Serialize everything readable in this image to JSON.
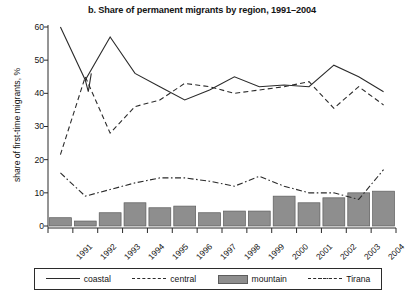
{
  "chart_data": {
    "type": "bar",
    "title": "b. Share of permanent migrants by region, 1991–2004",
    "xlabel": "",
    "ylabel": "share of first-time migrants, %",
    "ylim": [
      0,
      60
    ],
    "yticks": [
      0,
      10,
      20,
      30,
      40,
      50,
      60
    ],
    "grid": false,
    "legend_position": "bottom",
    "categories": [
      "1991",
      "1992",
      "1993",
      "1994",
      "1995",
      "1996",
      "1997",
      "1998",
      "1999",
      "2000",
      "2001",
      "2002",
      "2003",
      "2004"
    ],
    "series": [
      {
        "name": "coastal",
        "render": "line",
        "style": "solid",
        "color": "#2b2b2b",
        "values": [
          60,
          44,
          57,
          46,
          42,
          38,
          41,
          45,
          42,
          42.5,
          42,
          48.5,
          45,
          40.5
        ]
      },
      {
        "name": "central",
        "render": "line",
        "style": "dashed",
        "color": "#2b2b2b",
        "values": [
          21.5,
          45,
          28,
          36,
          38,
          43,
          42,
          40,
          41,
          42,
          43.5,
          35.5,
          42,
          36.5
        ]
      },
      {
        "name": "mountain",
        "render": "bar",
        "style": "filled",
        "color": "#8e8e8e",
        "values": [
          2.5,
          1.5,
          4,
          7,
          5.5,
          6,
          4,
          4.5,
          4.5,
          9,
          7,
          8.5,
          10,
          10.5
        ]
      },
      {
        "name": "Tirana",
        "render": "line",
        "style": "dash-dot",
        "color": "#2b2b2b",
        "values": [
          16,
          9,
          11,
          13,
          14.5,
          14.5,
          13.5,
          12,
          15,
          12,
          10,
          10,
          8,
          17
        ]
      }
    ]
  },
  "legend": {
    "items": [
      {
        "label": "coastal",
        "swatch": "solid-line-swatch"
      },
      {
        "label": "central",
        "swatch": "dashed-line-swatch"
      },
      {
        "label": "mountain",
        "swatch": "gray-bar-swatch"
      },
      {
        "label": "Tirana",
        "swatch": "dash-dot-line-swatch"
      }
    ]
  }
}
